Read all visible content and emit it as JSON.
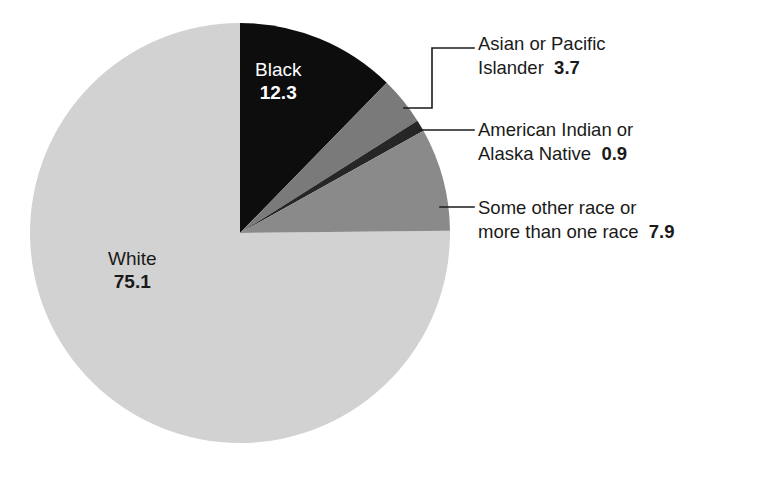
{
  "chart_data": {
    "type": "pie",
    "title": "",
    "subtitle": "",
    "xlabel": "",
    "ylabel": "",
    "unit": "percent",
    "legend_position": "callout-labels",
    "grid": false,
    "categories": [
      "White",
      "Black",
      "Asian or Pacific Islander",
      "American Indian or Alaska Native",
      "Some other race or more than one race"
    ],
    "values": [
      75.1,
      12.3,
      3.7,
      0.9,
      7.9
    ],
    "slices": [
      {
        "name": "Black",
        "value": 12.3,
        "value_text": "12.3",
        "label_text": "Black",
        "color": "#0d0d0d",
        "label_placement": "inside",
        "text_color": "#ffffff"
      },
      {
        "name": "Asian or Pacific Islander",
        "value": 3.7,
        "value_text": "3.7",
        "label_line1": "Asian or Pacific",
        "label_line2": "Islander",
        "color": "#7a7a7a",
        "label_placement": "callout"
      },
      {
        "name": "American Indian or Alaska Native",
        "value": 0.9,
        "value_text": "0.9",
        "label_line1": "American Indian or",
        "label_line2": "Alaska Native",
        "color": "#262626",
        "label_placement": "callout"
      },
      {
        "name": "Some other race or more than one race",
        "value": 7.9,
        "value_text": "7.9",
        "label_line1": "Some other race or",
        "label_line2": "more than one race",
        "color": "#8a8a8a",
        "label_placement": "callout"
      },
      {
        "name": "White",
        "value": 75.1,
        "value_text": "75.1",
        "label_text": "White",
        "color": "#d2d2d2",
        "label_placement": "inside",
        "text_color": "#1a1a1a"
      }
    ],
    "geometry": {
      "center_x": 240,
      "center_y": 233,
      "radius": 210,
      "start_angle_deg": -90,
      "direction": "clockwise"
    },
    "colors": {
      "background": "#ffffff",
      "outline": "#000000",
      "leader_line": "#1a1a1a"
    }
  }
}
